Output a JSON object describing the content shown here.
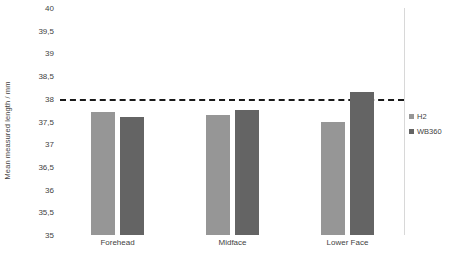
{
  "chart_data": {
    "type": "bar",
    "title": "",
    "xlabel": "",
    "ylabel": "Mean measured length / mm",
    "categories": [
      "Forehead",
      "Midface",
      "Lower Face"
    ],
    "series": [
      {
        "name": "H2",
        "color": "#969696",
        "values": [
          37.7,
          37.65,
          37.5
        ]
      },
      {
        "name": "WB360",
        "color": "#646464",
        "values": [
          37.6,
          37.75,
          38.15
        ]
      }
    ],
    "ylim": [
      35,
      40
    ],
    "ytick_step": 0.5,
    "ytick_labels": [
      "40",
      "39,5",
      "39",
      "38,5",
      "38",
      "37,5",
      "37",
      "36,5",
      "36",
      "35,5",
      "35"
    ],
    "ytick_values": [
      40,
      39.5,
      39,
      38.5,
      38,
      37.5,
      37,
      36.5,
      36,
      35.5,
      35
    ],
    "grid": false,
    "legend_position": "right",
    "annotations": [
      {
        "type": "reference-line",
        "orientation": "horizontal",
        "value": 38,
        "style": "dashed",
        "color": "#1a1a1a"
      }
    ]
  }
}
